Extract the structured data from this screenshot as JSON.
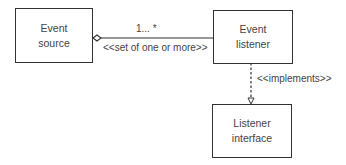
{
  "diagram": {
    "type": "UML class diagram",
    "nodes": [
      {
        "id": "event-source",
        "label": "Event\nsource"
      },
      {
        "id": "event-listener",
        "label": "Event\nlistener"
      },
      {
        "id": "listener-interface",
        "label": "Listener\ninterface"
      }
    ],
    "edges": [
      {
        "from": "event-source",
        "to": "event-listener",
        "kind": "aggregation",
        "multiplicity": "1... *",
        "stereotype": "<<set of one or more>>"
      },
      {
        "from": "event-listener",
        "to": "listener-interface",
        "kind": "realization",
        "stereotype": "<<implements>>"
      }
    ]
  },
  "colors": {
    "line": "#333333",
    "text": "#444444",
    "background": "#ffffff"
  }
}
